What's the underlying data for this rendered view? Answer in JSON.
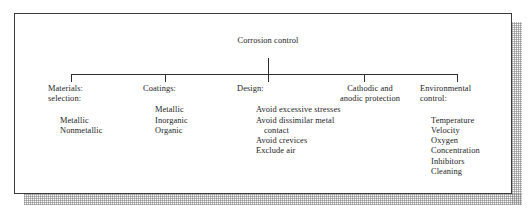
{
  "figure": {
    "kind": "tree-diagram",
    "root": {
      "label": "Corrosion\ncontrol"
    },
    "branches": [
      {
        "id": "materials",
        "title": "Materials:\nselection:",
        "align": "left",
        "items": [
          "Metallic",
          "Nonmetallic"
        ]
      },
      {
        "id": "coatings",
        "title": "Coatings:",
        "align": "left",
        "items": [
          "Metallic",
          "Inorganic",
          "Organic"
        ]
      },
      {
        "id": "design",
        "title": "Design:",
        "align": "left",
        "items": [
          "Avoid excessive stresses",
          "Avoid dissimilar metal contact",
          "Avoid crevices",
          "Exclude air"
        ]
      },
      {
        "id": "cathodic",
        "title": "Cathodic and\nanodic protection",
        "align": "center",
        "items": []
      },
      {
        "id": "environmental",
        "title": "Environmental\ncontrol:",
        "align": "left",
        "items": [
          "Temperature",
          "Velocity",
          "Oxygen",
          "Concentration",
          "Inhibitors",
          "Cleaning"
        ]
      }
    ]
  },
  "colors": {
    "ink": "#1c1c1c",
    "rule": "#3a3a3a",
    "connector": "#2e2e2e",
    "paper": "#ffffff",
    "shadow": "#5a5a5a"
  }
}
